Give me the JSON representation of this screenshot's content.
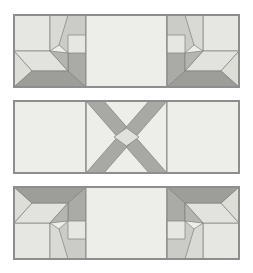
{
  "figure": {
    "width": 253,
    "height": 273,
    "background_color": "#ffffff"
  },
  "palette": {
    "background": "#ffffff",
    "cream": "#eeeeea",
    "light": "#e4e4e0",
    "light_mid": "#d6d6d2",
    "mid": "#c3c3c0",
    "mid_dark": "#a9a9a6",
    "dark": "#999996",
    "outline": "#8e8e8e",
    "line": "#7f7f7f"
  },
  "panels": [
    {
      "name": "top-panel",
      "label": "Top Row",
      "blocks": [
        {
          "name": "top-left-block",
          "label": "Fan / Star Corner Block",
          "orientation": "upright-left"
        },
        {
          "name": "top-center-block",
          "label": "Plain Background Block",
          "orientation": "plain"
        },
        {
          "name": "top-right-block",
          "label": "Fan / Star Corner Block",
          "orientation": "upright-right-mirrored"
        }
      ]
    },
    {
      "name": "middle-panel",
      "label": "Middle Row",
      "blocks": [
        {
          "name": "middle-left-block",
          "label": "Plain Background Block",
          "orientation": "plain"
        },
        {
          "name": "middle-center-block",
          "label": "Crossed X Block",
          "orientation": "x-cross"
        },
        {
          "name": "middle-right-block",
          "label": "Plain Background Block",
          "orientation": "plain"
        }
      ]
    },
    {
      "name": "bottom-panel",
      "label": "Bottom Row",
      "blocks": [
        {
          "name": "bottom-left-block",
          "label": "Fan / Star Corner Block",
          "orientation": "flipped-left"
        },
        {
          "name": "bottom-center-block",
          "label": "Plain Background Block",
          "orientation": "plain"
        },
        {
          "name": "bottom-right-block",
          "label": "Fan / Star Corner Block",
          "orientation": "flipped-right-mirrored"
        }
      ]
    }
  ]
}
